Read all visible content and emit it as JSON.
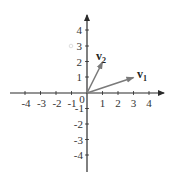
{
  "diagram": {
    "type": "vector-plot",
    "axes": {
      "x_range": [
        -4,
        4
      ],
      "y_range": [
        -4,
        4
      ],
      "x_ticks": [
        "-4",
        "-3",
        "-2",
        "-1",
        "1",
        "2",
        "3",
        "4"
      ],
      "y_ticks_positive": [
        "4",
        "3",
        "2",
        "1"
      ],
      "y_ticks_negative": [
        "-1",
        "-2",
        "-3",
        "-4"
      ],
      "origin_label": "0"
    },
    "vectors": [
      {
        "name": "v",
        "subscript": "1",
        "x": 3,
        "y": 1,
        "color": "#7a7a7a"
      },
      {
        "name": "v",
        "subscript": "2",
        "x": 1,
        "y": 2,
        "color": "#7a7a7a"
      }
    ],
    "colors": {
      "axis": "#2a2a2a",
      "vector": "#7a7a7a",
      "text": "#333333"
    }
  }
}
